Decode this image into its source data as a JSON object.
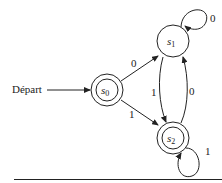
{
  "diagram": {
    "type": "finite-state-automaton",
    "start_label": "Départ",
    "states": [
      {
        "id": "s0",
        "name": "s",
        "sub": "0",
        "accepting": true,
        "start": true
      },
      {
        "id": "s1",
        "name": "s",
        "sub": "1",
        "accepting": false
      },
      {
        "id": "s2",
        "name": "s",
        "sub": "2",
        "accepting": true
      }
    ],
    "transitions": [
      {
        "from": "s0",
        "to": "s1",
        "label": "0"
      },
      {
        "from": "s0",
        "to": "s2",
        "label": "1"
      },
      {
        "from": "s1",
        "to": "s1",
        "label": "0"
      },
      {
        "from": "s1",
        "to": "s2",
        "label": "1"
      },
      {
        "from": "s2",
        "to": "s1",
        "label": "0"
      },
      {
        "from": "s2",
        "to": "s2",
        "label": "1"
      }
    ]
  },
  "colors": {
    "ink": "#222222",
    "background": "#ffffff"
  }
}
